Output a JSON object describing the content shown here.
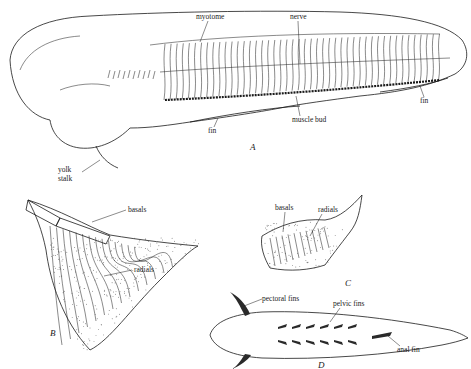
{
  "figure": {
    "panels": [
      {
        "id": "A",
        "label": "A",
        "description": "lateral view of embryo showing fin fold development",
        "labels": {
          "myotome": "myotome",
          "nerve": "nerve",
          "muscle_bud": "muscle bud",
          "fin_1": "fin",
          "fin_2": "fin",
          "yolk": "yolk",
          "stalk": "stalk"
        }
      },
      {
        "id": "B",
        "label": "B",
        "labels": {
          "basals": "basals",
          "radials": "radials"
        }
      },
      {
        "id": "C",
        "label": "C",
        "labels": {
          "basals": "basals",
          "radials": "radials"
        }
      },
      {
        "id": "D",
        "label": "D",
        "description": "ventral view of fish showing paired and median fins",
        "labels": {
          "pectoral_fins": "pectoral fins",
          "pelvic_fins": "pelvic fins",
          "anal_fin": "anal fin"
        }
      }
    ]
  }
}
